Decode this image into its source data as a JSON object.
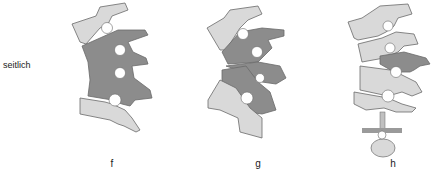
{
  "row_label": "seitlich",
  "panels": [
    {
      "id": "f",
      "label": "f"
    },
    {
      "id": "g",
      "label": "g"
    },
    {
      "id": "h",
      "label": "h"
    }
  ],
  "colors": {
    "light_bone": "#d9d9d9",
    "dark_fused": "#8c8c8c",
    "outline": "#6a6a6a",
    "background": "#ffffff"
  }
}
